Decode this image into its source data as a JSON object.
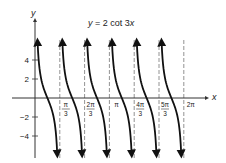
{
  "chart_data": {
    "type": "line",
    "title": "y = 2 cot 3x",
    "title_parts": {
      "lhs": "y",
      "eq": " = 2 cot 3",
      "var": "x"
    },
    "xlabel": "x",
    "ylabel": "y",
    "function": "2*cot(3x)",
    "xlim": [
      0,
      6.2832
    ],
    "ylim": [
      -5.8,
      5.8
    ],
    "grid": false,
    "legend": null,
    "x_ticks": [
      {
        "value": 1.0472,
        "num": "π",
        "den": "3"
      },
      {
        "value": 2.0944,
        "num": "2π",
        "den": "3"
      },
      {
        "value": 3.1416,
        "num": "π",
        "den": ""
      },
      {
        "value": 4.1888,
        "num": "4π",
        "den": "3"
      },
      {
        "value": 5.236,
        "num": "5π",
        "den": "3"
      },
      {
        "value": 6.2832,
        "num": "2π",
        "den": ""
      }
    ],
    "y_ticks": [
      {
        "value": 4,
        "label": "4"
      },
      {
        "value": 2,
        "label": "2"
      },
      {
        "value": -2,
        "label": "−2"
      },
      {
        "value": -4,
        "label": "−4"
      }
    ],
    "asymptotes": [
      "0",
      "π/3",
      "2π/3",
      "π",
      "4π/3",
      "5π/3",
      "2π"
    ],
    "branches": [
      {
        "from": "0",
        "to": "π/3"
      },
      {
        "from": "π/3",
        "to": "2π/3"
      },
      {
        "from": "2π/3",
        "to": "π"
      },
      {
        "from": "π",
        "to": "4π/3"
      },
      {
        "from": "4π/3",
        "to": "5π/3"
      },
      {
        "from": "5π/3",
        "to": "2π",
        "note": "only 5 drawn branches visible with arrows in sixth interval? rendered 6 asymptote gaps, 6 branches"
      }
    ],
    "colors": {
      "curve": "#111111",
      "axis": "#333333",
      "asymptote": "#777777"
    }
  }
}
